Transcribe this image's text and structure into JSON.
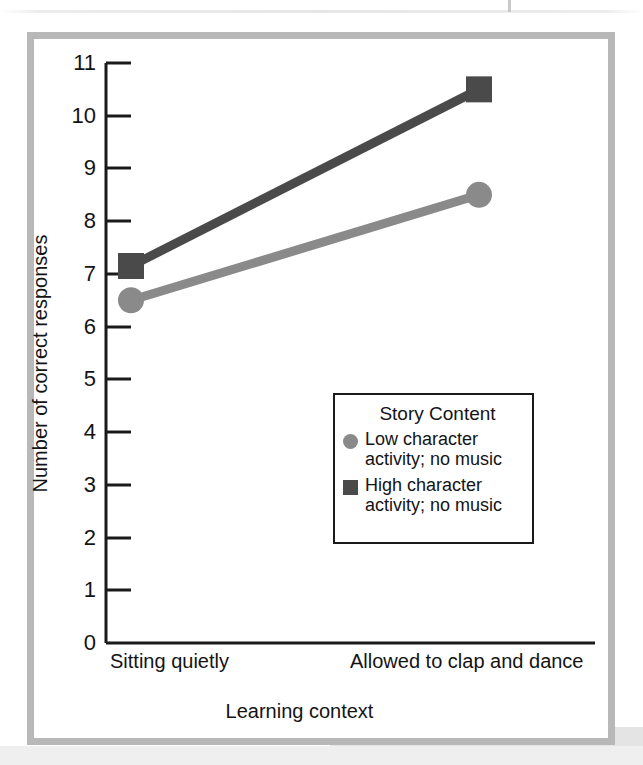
{
  "chart_data": {
    "type": "line",
    "title": "",
    "xlabel": "Learning context",
    "ylabel": "Number of correct responses",
    "categories": [
      "Sitting quietly",
      "Allowed to clap and dance"
    ],
    "ylim": [
      0,
      11
    ],
    "yticks": [
      0,
      1,
      2,
      3,
      4,
      5,
      6,
      7,
      8,
      9,
      10,
      11
    ],
    "ytick_labels": [
      "0",
      "1",
      "2",
      "3",
      "4",
      "5",
      "6",
      "7",
      "8",
      "9",
      "10",
      "11"
    ],
    "grid": false,
    "legend_position": "inside-center-right",
    "legend_title": "Story Content",
    "series": [
      {
        "name": "Low character activity; no music",
        "label_line1": "Low character",
        "label_line2": "activity; no music",
        "marker": "circle",
        "color": "#8a8a8a",
        "values": [
          6.5,
          8.5
        ]
      },
      {
        "name": "High character activity; no music",
        "label_line1": "High character",
        "label_line2": "activity; no music",
        "marker": "square",
        "color": "#4a4a4a",
        "values": [
          7.15,
          10.5
        ]
      }
    ]
  },
  "axis": {
    "ytick_0": "0",
    "ytick_1": "1",
    "ytick_2": "2",
    "ytick_3": "3",
    "ytick_4": "4",
    "ytick_5": "5",
    "ytick_6": "6",
    "ytick_7": "7",
    "ytick_8": "8",
    "ytick_9": "9",
    "ytick_10": "10",
    "ytick_11": "11",
    "y_title": "Number of correct responses",
    "x_title": "Learning context",
    "x_cat_left": "Sitting quietly",
    "x_cat_right": "Allowed to clap and dance"
  },
  "legend": {
    "title": "Story Content",
    "entry_low_line1": "Low character",
    "entry_low_line2": "activity; no music",
    "entry_high_line1": "High character",
    "entry_high_line2": "activity; no music"
  },
  "colors": {
    "series_low": "#8a8a8a",
    "series_high": "#4a4a4a",
    "axis": "#1a1a1a",
    "frame": "#b8b8b8",
    "text": "#141414",
    "background": "#ffffff"
  }
}
